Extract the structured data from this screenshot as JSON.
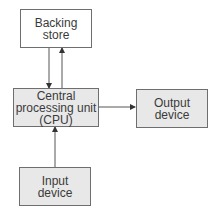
{
  "diagram": {
    "nodes": {
      "backing_store": {
        "label": "Backing\nstore",
        "fill": "#ffffff"
      },
      "cpu": {
        "label": "Central\nprocessing unit\n(CPU)",
        "fill": "#e8e8e8"
      },
      "output": {
        "label": "Output\ndevice",
        "fill": "#e8e8e8"
      },
      "input": {
        "label": "Input\ndevice",
        "fill": "#e8e8e8"
      }
    },
    "edges": [
      {
        "from": "backing_store",
        "to": "cpu"
      },
      {
        "from": "cpu",
        "to": "backing_store"
      },
      {
        "from": "cpu",
        "to": "output"
      },
      {
        "from": "input",
        "to": "cpu"
      }
    ]
  }
}
